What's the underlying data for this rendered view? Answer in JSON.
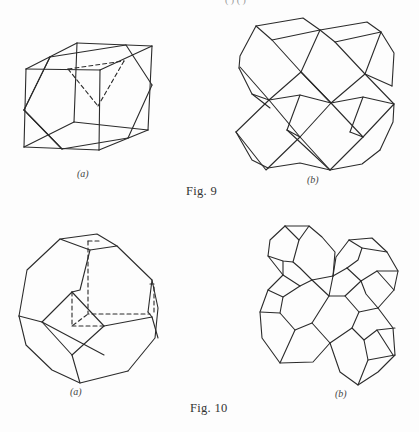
{
  "page": {
    "top_fragment": "( ) ( )"
  },
  "figures": [
    {
      "id": "fig9",
      "caption": "Fig. 9",
      "caption_pos": [
        186,
        185
      ],
      "panels": [
        {
          "id": "fig9a",
          "label": "(a)",
          "label_pos": [
            77,
            168
          ],
          "description": "cube with inscribed cuboctahedron-like truncation lines and dashed hidden edges",
          "solid_lines": [
            [
              [
                26,
                69
              ],
              [
                100,
                70
              ]
            ],
            [
              [
                100,
                70
              ],
              [
                99,
                150
              ]
            ],
            [
              [
                99,
                150
              ],
              [
                24,
                147
              ]
            ],
            [
              [
                24,
                147
              ],
              [
                26,
                69
              ]
            ],
            [
              [
                77,
                43
              ],
              [
                152,
                46
              ]
            ],
            [
              [
                152,
                46
              ],
              [
                148,
                130
              ]
            ],
            [
              [
                148,
                130
              ],
              [
                74,
                122
              ]
            ],
            [
              [
                74,
                122
              ],
              [
                77,
                43
              ]
            ],
            [
              [
                26,
                69
              ],
              [
                77,
                43
              ]
            ],
            [
              [
                100,
                70
              ],
              [
                152,
                46
              ]
            ],
            [
              [
                99,
                150
              ],
              [
                148,
                130
              ]
            ],
            [
              [
                24,
                147
              ],
              [
                74,
                122
              ]
            ],
            [
              [
                50,
                57
              ],
              [
                126,
                45
              ]
            ],
            [
              [
                126,
                45
              ],
              [
                152,
                85
              ]
            ],
            [
              [
                152,
                85
              ],
              [
                128,
                138
              ]
            ],
            [
              [
                128,
                138
              ],
              [
                62,
                149
              ]
            ],
            [
              [
                62,
                149
              ],
              [
                24,
                110
              ]
            ],
            [
              [
                24,
                110
              ],
              [
                50,
                57
              ]
            ],
            [
              [
                50,
                57
              ],
              [
                24,
                110
              ]
            ],
            [
              [
                62,
                149
              ],
              [
                24,
                110
              ]
            ]
          ],
          "dashed_lines": [
            [
              [
                68,
                69
              ],
              [
                124,
                61
              ]
            ],
            [
              [
                68,
                69
              ],
              [
                98,
                106
              ]
            ],
            [
              [
                124,
                61
              ],
              [
                98,
                106
              ]
            ]
          ]
        },
        {
          "id": "fig9b",
          "label": "(b)",
          "label_pos": [
            307,
            178
          ],
          "description": "space-filling packing of four rhombic dodecahedra"
        }
      ]
    },
    {
      "id": "fig10",
      "caption": "Fig. 10",
      "caption_pos": [
        190,
        402
      ],
      "panels": [
        {
          "id": "fig10a",
          "label": "(a)",
          "label_pos": [
            70,
            388
          ],
          "description": "truncated octahedron with dashed hidden cube edges"
        },
        {
          "id": "fig10b",
          "label": "(b)",
          "label_pos": [
            335,
            390
          ],
          "description": "space-filling packing of four truncated octahedra"
        }
      ]
    }
  ]
}
